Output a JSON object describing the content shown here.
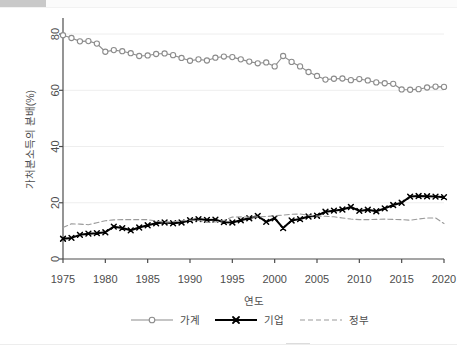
{
  "chart_data": {
    "type": "line",
    "title": "",
    "xlabel": "연도",
    "ylabel": "가처분소득의 분배(%)",
    "xlim": [
      1975,
      2020
    ],
    "ylim": [
      0,
      85
    ],
    "xticks": [
      1975,
      1980,
      1985,
      1990,
      1995,
      2000,
      2005,
      2010,
      2015,
      2020
    ],
    "yticks": [
      0,
      20,
      40,
      60,
      80
    ],
    "grid": "horizontal",
    "legend_position": "bottom",
    "x": [
      1975,
      1976,
      1977,
      1978,
      1979,
      1980,
      1981,
      1982,
      1983,
      1984,
      1985,
      1986,
      1987,
      1988,
      1989,
      1990,
      1991,
      1992,
      1993,
      1994,
      1995,
      1996,
      1997,
      1998,
      1999,
      2000,
      2001,
      2002,
      2003,
      2004,
      2005,
      2006,
      2007,
      2008,
      2009,
      2010,
      2011,
      2012,
      2013,
      2014,
      2015,
      2016,
      2017,
      2018,
      2019,
      2020
    ],
    "series": [
      {
        "name": "가계",
        "marker": "circle",
        "style": "solid",
        "color": "#8c8c8c",
        "values": [
          79.6,
          78.6,
          77.4,
          77.5,
          76.6,
          73.7,
          74.3,
          73.9,
          73.2,
          72.2,
          72.4,
          72.9,
          73.1,
          72.5,
          71.5,
          70.5,
          71.0,
          70.6,
          71.6,
          72.0,
          71.8,
          71.0,
          70.2,
          69.6,
          69.9,
          68.5,
          72.2,
          70.1,
          68.5,
          66.5,
          65.1,
          63.8,
          64.1,
          64.2,
          63.6,
          64.0,
          63.5,
          62.8,
          62.5,
          62.3,
          60.3,
          60.2,
          60.4,
          61.0,
          61.3,
          61.2
        ]
      },
      {
        "name": "기업",
        "marker": "x",
        "style": "solid",
        "color": "#000000",
        "values": [
          7.2,
          7.5,
          8.6,
          9.0,
          9.2,
          9.5,
          11.5,
          11.0,
          10.2,
          11.2,
          12.0,
          12.7,
          13.0,
          12.7,
          13.0,
          13.8,
          14.2,
          13.9,
          14.0,
          13.1,
          13.0,
          13.8,
          14.5,
          15.3,
          13.2,
          14.5,
          11.0,
          13.7,
          14.2,
          15.1,
          15.4,
          16.8,
          17.2,
          17.6,
          18.5,
          17.1,
          17.5,
          17.0,
          18.0,
          19.2,
          20.0,
          22.2,
          22.4,
          22.3,
          22.2,
          22.0
        ]
      },
      {
        "name": "정부",
        "marker": "none",
        "style": "dashed",
        "color": "#9a9a9a",
        "values": [
          11.2,
          12.5,
          12.4,
          12.2,
          12.9,
          13.6,
          13.9,
          14.0,
          14.0,
          14.0,
          14.0,
          13.5,
          13.1,
          13.2,
          13.6,
          13.8,
          13.8,
          13.0,
          13.2,
          13.7,
          14.9,
          15.0,
          14.9,
          15.0,
          15.1,
          15.4,
          15.6,
          15.9,
          16.0,
          15.6,
          15.3,
          15.2,
          15.0,
          14.6,
          14.2,
          14.0,
          14.0,
          14.1,
          14.2,
          14.1,
          14.0,
          13.8,
          14.2,
          14.6,
          14.6,
          12.6
        ]
      }
    ]
  },
  "axes": {
    "y_title": "가처분소득의 분배(%)",
    "x_title": "연도",
    "y_tick_labels": [
      "0",
      "20",
      "40",
      "60",
      "80"
    ],
    "x_tick_labels": [
      "1975",
      "1980",
      "1985",
      "1990",
      "1995",
      "2000",
      "2005",
      "2010",
      "2015",
      "2020"
    ]
  },
  "legend": {
    "items": [
      {
        "label": "가계"
      },
      {
        "label": "기업"
      },
      {
        "label": "정부"
      }
    ]
  },
  "colors": {
    "household": "#8c8c8c",
    "corporate": "#000000",
    "government": "#9a9a9a",
    "axis": "#4d4d4d",
    "grid": "#eeeeee",
    "background": "#ffffff"
  }
}
